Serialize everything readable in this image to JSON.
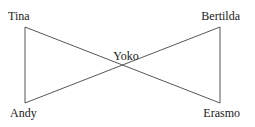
{
  "diagram": {
    "type": "graph",
    "nodes": [
      {
        "id": "tina",
        "label": "Tina",
        "x": 25,
        "y": 27,
        "label_x": 8,
        "label_y": 20,
        "anchor": "start"
      },
      {
        "id": "bertilda",
        "label": "Bertilda",
        "x": 220,
        "y": 27,
        "label_x": 240,
        "label_y": 20,
        "anchor": "end"
      },
      {
        "id": "yoko",
        "label": "Yoko",
        "x": 123,
        "y": 65,
        "label_x": 126,
        "label_y": 60,
        "anchor": "middle"
      },
      {
        "id": "andy",
        "label": "Andy",
        "x": 25,
        "y": 103,
        "label_x": 10,
        "label_y": 117,
        "anchor": "start"
      },
      {
        "id": "erasmo",
        "label": "Erasmo",
        "x": 220,
        "y": 103,
        "label_x": 240,
        "label_y": 117,
        "anchor": "end"
      }
    ],
    "edges": [
      {
        "from": "tina",
        "to": "andy"
      },
      {
        "from": "bertilda",
        "to": "erasmo"
      },
      {
        "from": "tina",
        "to": "erasmo"
      },
      {
        "from": "andy",
        "to": "bertilda"
      }
    ],
    "colors": {
      "edge": "#444444",
      "text": "#1a1a1a",
      "background": "#ffffff"
    }
  }
}
